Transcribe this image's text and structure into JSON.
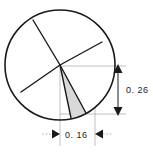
{
  "figure": {
    "type": "geometry-diagram",
    "background_color": "#ffffff",
    "stroke_color": "#1a1a1a",
    "shade_color": "#d9d9d9",
    "thin_line_color": "#b0b0b0",
    "circle": {
      "name": "main-circle",
      "center_x": 60,
      "center_y": 65,
      "radius": 55
    },
    "radii": [
      {
        "name": "radius-upper-left",
        "end_x": 33,
        "end_y": 20
      },
      {
        "name": "radius-upper-right",
        "end_x": 102,
        "end_y": 42
      },
      {
        "name": "radius-lower-left",
        "end_x": 21,
        "end_y": 92
      },
      {
        "name": "wedge-edge-left",
        "end_x": 71,
        "end_y": 118
      },
      {
        "name": "wedge-edge-right",
        "end_x": 86,
        "end_y": 113
      }
    ],
    "shaded_wedge": {
      "name": "shaded-wedge",
      "fill": "#d9d9d9"
    }
  },
  "dimensions": {
    "vertical": {
      "name": "vertical-dimension",
      "label": "0. 26",
      "value": 0.26,
      "orientation": "vertical",
      "arrow_top_direction": "up",
      "arrow_bottom_direction": "down",
      "line_x": 118,
      "top_y": 66,
      "bottom_y": 114,
      "label_x": 126,
      "label_y": 93
    },
    "horizontal": {
      "name": "horizontal-dimension",
      "label": "0. 16",
      "value": 0.16,
      "orientation": "horizontal",
      "arrow_left_direction": "right",
      "arrow_right_direction": "left",
      "line_y": 134,
      "left_x": 60,
      "right_x": 95,
      "label_x": 66,
      "label_y": 138
    }
  },
  "extension_lines": [
    {
      "name": "ext-line-vertical-top",
      "x1": 60,
      "y1": 66,
      "x2": 126,
      "y2": 66
    },
    {
      "name": "ext-line-vertical-bottom",
      "x1": 60,
      "y1": 114,
      "x2": 126,
      "y2": 114
    },
    {
      "name": "ext-line-horizontal-left",
      "x1": 60,
      "y1": 66,
      "x2": 60,
      "y2": 146
    },
    {
      "name": "ext-line-horizontal-right",
      "x1": 95,
      "y1": 110,
      "x2": 95,
      "y2": 146
    }
  ]
}
